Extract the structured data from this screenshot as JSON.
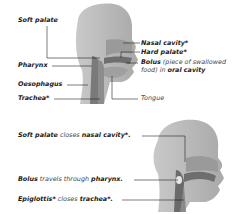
{
  "diagram1": {
    "labels": {
      "soft_palate": "Soft palate",
      "nasal_cavity": "Nasal cavity*",
      "hard_palate": "Hard palate*",
      "bolus_bold": "Bolus",
      "bolus_desc1": "(piece of swallowed",
      "bolus_desc2": "food) in",
      "oral_cavity": "oral cavity",
      "pharynx": "Pharynx",
      "oesophagus": "Oesophagus",
      "trachea": "Trachea*",
      "tongue": "Tongue"
    }
  },
  "diagram2": {
    "labels": {
      "soft_palate": "Soft palate",
      "closes1": "closes",
      "nasal_cavity": "nasal cavity*.",
      "bolus": "Bolus",
      "travels": "travels through",
      "pharynx": "pharynx.",
      "epiglottis": "Epiglottis*",
      "closes2": "closes",
      "trachea": "trachea*."
    }
  },
  "colors": {
    "head": "#b8b8b8",
    "head_light": "#d0d0d0",
    "tract": "#707070",
    "leader_line": "#222222"
  }
}
